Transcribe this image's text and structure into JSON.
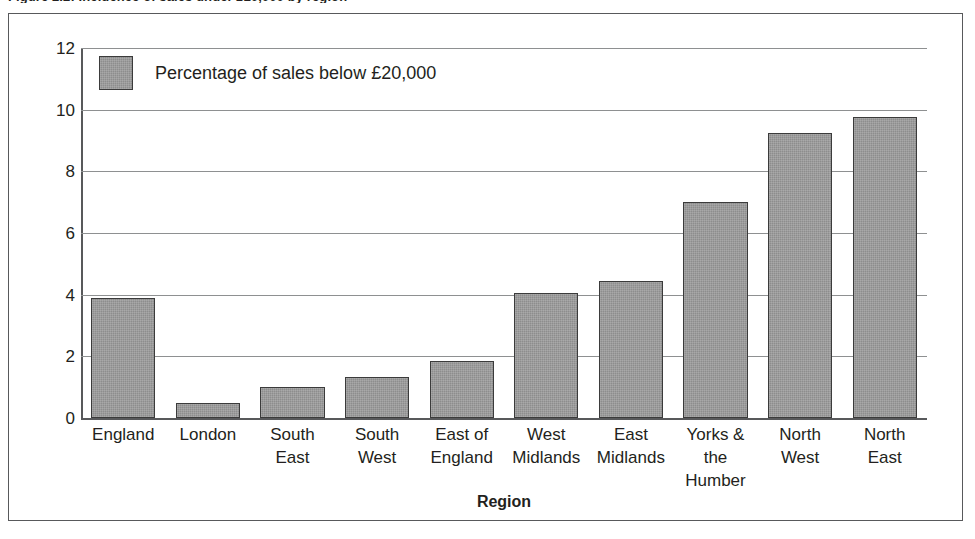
{
  "figure": {
    "caption": "Figure 2.2: Incidence of sales under £20,000 by region"
  },
  "chart_data": {
    "type": "bar",
    "title": "",
    "xlabel": "Region",
    "ylabel": "",
    "ylim": [
      0,
      12
    ],
    "yticks": [
      0,
      2,
      4,
      6,
      8,
      10,
      12
    ],
    "grid": true,
    "legend_position": "top-left",
    "bar_color": "#8d8d8d",
    "bar_border_color": "#3b3b3b",
    "series": [
      {
        "name": "Percentage of sales below £20,000",
        "values": [
          3.9,
          0.5,
          1.0,
          1.33,
          1.85,
          4.05,
          4.45,
          7.0,
          9.25,
          9.75
        ]
      }
    ],
    "categories": [
      "England",
      "London",
      "South East",
      "South West",
      "East of England",
      "West Midlands",
      "East Midlands",
      "Yorks & the Humber",
      "North West",
      "North East"
    ],
    "category_lines": [
      [
        "England"
      ],
      [
        "London"
      ],
      [
        "South",
        "East"
      ],
      [
        "South",
        "West"
      ],
      [
        "East of",
        "England"
      ],
      [
        "West",
        "Midlands"
      ],
      [
        "East",
        "Midlands"
      ],
      [
        "Yorks & the",
        "Humber"
      ],
      [
        "North",
        "West"
      ],
      [
        "North",
        "East"
      ]
    ]
  }
}
